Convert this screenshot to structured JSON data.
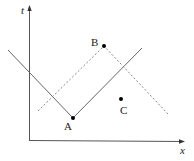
{
  "diagram": {
    "axes": {
      "vertical_label": "t",
      "horizontal_label": "x"
    },
    "points": [
      {
        "id": "A",
        "label": "A",
        "x": 73,
        "y": 118
      },
      {
        "id": "B",
        "label": "B",
        "x": 104,
        "y": 46
      },
      {
        "id": "C",
        "label": "C",
        "x": 121,
        "y": 99
      }
    ],
    "lines": [
      {
        "name": "solid-v-line",
        "style": "solid",
        "through": "A"
      },
      {
        "name": "dashed-inverted-v-line",
        "style": "dashed",
        "through": "B"
      }
    ],
    "colors": {
      "axis": "#555555",
      "solid_line": "#666666",
      "dashed_line": "#888888",
      "point": "#000000",
      "text": "#222222"
    }
  }
}
